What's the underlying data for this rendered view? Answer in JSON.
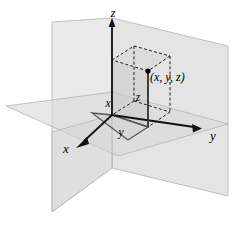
{
  "figure": {
    "type": "3d-coordinate-diagram",
    "background_color": "#ffffff"
  },
  "axes": {
    "z": {
      "label": "z",
      "label_x": 113,
      "label_y": 17,
      "direction": "up"
    },
    "y": {
      "label": "y",
      "label_x": 213,
      "label_y": 140,
      "direction": "right"
    },
    "x": {
      "label": "x",
      "label_x": 66,
      "label_y": 153,
      "direction": "lower-left"
    }
  },
  "point": {
    "label": "(x, y, z)",
    "label_x": 150,
    "label_y": 80,
    "marker_x": 148,
    "marker_y": 71
  },
  "dimensions": [
    {
      "name": "x-extent-label",
      "label": "x",
      "label_x": 108,
      "label_y": 107
    },
    {
      "name": "z-extent-label",
      "label": "z",
      "label_x": 137,
      "label_y": 101
    },
    {
      "name": "y-extent-label",
      "label": "y",
      "label_x": 120,
      "label_y": 135
    }
  ],
  "planes": [
    {
      "name": "yz-plane",
      "fill": "#dcdcdc",
      "stroke": "#b4b4b4",
      "opacity": 0.55
    },
    {
      "name": "xz-plane",
      "fill": "#d2d2d2",
      "stroke": "#b0b0b0",
      "opacity": 0.55
    },
    {
      "name": "xy-plane",
      "fill": "#d8d8d8",
      "stroke": "#b4b4b4",
      "opacity": 0.55
    }
  ],
  "box": {
    "name": "reference-box",
    "solid_edge_color": "#4d4d4d",
    "dashed_edge_color": "#222222",
    "face_fill": "#c8c8c8"
  },
  "colors": {
    "axis": "#111111",
    "plane_light": "#dcdcdc",
    "plane_mid": "#d2d2d2",
    "plane_edge": "#b0b0b0",
    "text": "#000000"
  }
}
